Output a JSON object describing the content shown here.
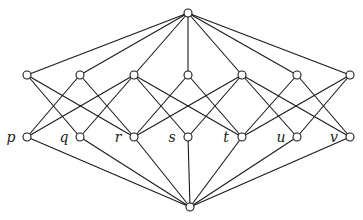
{
  "diagram": {
    "type": "hasse-diagram-lattice",
    "colors": {
      "line": "#1a1a1a",
      "node_fill": "#ffffff",
      "background": "#ffffff"
    },
    "node_radius": 4,
    "top": {
      "id": "top",
      "x": 188,
      "y": 13
    },
    "bottom": {
      "id": "bottom",
      "x": 190,
      "y": 207
    },
    "upper_row": [
      {
        "id": "a1",
        "x": 27,
        "y": 75
      },
      {
        "id": "a2",
        "x": 80,
        "y": 75
      },
      {
        "id": "a3",
        "x": 134,
        "y": 75
      },
      {
        "id": "a4",
        "x": 188,
        "y": 75
      },
      {
        "id": "a5",
        "x": 242,
        "y": 75
      },
      {
        "id": "a6",
        "x": 297,
        "y": 75
      },
      {
        "id": "a7",
        "x": 350,
        "y": 75
      }
    ],
    "lower_row": [
      {
        "id": "p",
        "label": "p",
        "x": 27,
        "y": 137
      },
      {
        "id": "q",
        "label": "q",
        "x": 80,
        "y": 137
      },
      {
        "id": "r",
        "label": "r",
        "x": 134,
        "y": 137
      },
      {
        "id": "s",
        "label": "s",
        "x": 188,
        "y": 137
      },
      {
        "id": "t",
        "label": "t",
        "x": 242,
        "y": 137
      },
      {
        "id": "u",
        "label": "u",
        "x": 297,
        "y": 137
      },
      {
        "id": "v",
        "label": "v",
        "x": 350,
        "y": 137
      }
    ],
    "middle_edges": [
      [
        "a1",
        "q"
      ],
      [
        "a1",
        "r"
      ],
      [
        "a2",
        "p"
      ],
      [
        "a2",
        "r"
      ],
      [
        "a3",
        "p"
      ],
      [
        "a3",
        "q"
      ],
      [
        "a3",
        "s"
      ],
      [
        "a3",
        "t"
      ],
      [
        "a4",
        "r"
      ],
      [
        "a4",
        "t"
      ],
      [
        "a5",
        "r"
      ],
      [
        "a5",
        "s"
      ],
      [
        "a5",
        "u"
      ],
      [
        "a5",
        "v"
      ],
      [
        "a6",
        "t"
      ],
      [
        "a6",
        "v"
      ],
      [
        "a7",
        "t"
      ],
      [
        "a7",
        "u"
      ]
    ]
  }
}
